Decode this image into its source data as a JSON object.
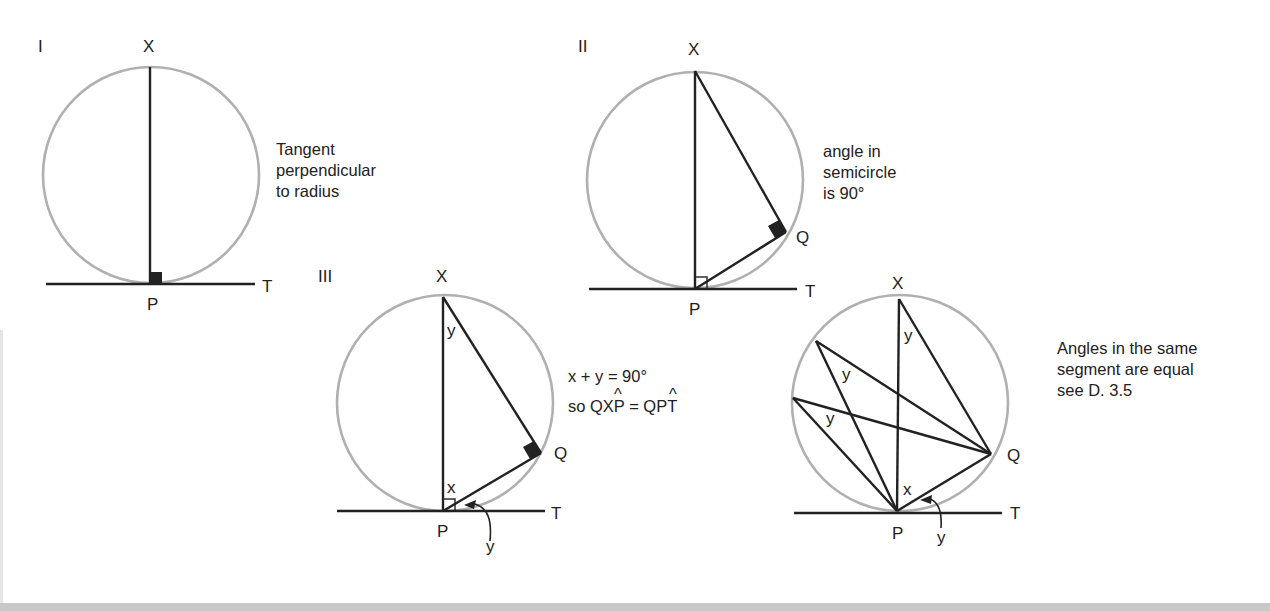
{
  "figure": {
    "panels": [
      {
        "id": "I",
        "numeral": "I",
        "caption_lines": [
          "Tangent",
          "perpendicular",
          "to radius"
        ],
        "labels": {
          "top": "X",
          "bottom": "P",
          "tangent_end": "T"
        }
      },
      {
        "id": "II",
        "numeral": "II",
        "caption_lines": [
          "angle in",
          "semicircle",
          "is 90°"
        ],
        "labels": {
          "top": "X",
          "bottom": "P",
          "chord_point": "Q",
          "tangent_end": "T"
        }
      },
      {
        "id": "III",
        "numeral": "III",
        "caption_lines": [
          "x + y = 90°",
          "so QXP = QPT"
        ],
        "hatted_letters": [
          "X",
          "P"
        ],
        "labels": {
          "top": "X",
          "bottom": "P",
          "chord_point": "Q",
          "tangent_end": "T",
          "angle_at_X": "y",
          "angle_at_P": "x",
          "tangent_angle": "y"
        }
      },
      {
        "id": "IV",
        "numeral": "",
        "caption_lines": [
          "Angles in the same",
          "segment are equal",
          "see D. 3.5"
        ],
        "labels": {
          "top": "X",
          "bottom": "P",
          "chord_point": "Q",
          "tangent_end": "T",
          "angle_at_X": "y",
          "angle_at_A": "y",
          "angle_at_B": "y",
          "angle_at_P": "x",
          "tangent_angle": "y"
        }
      }
    ]
  },
  "colors": {
    "circle": "#b0b0b0",
    "line": "#222222",
    "text": "#222222",
    "background": "#ffffff"
  }
}
